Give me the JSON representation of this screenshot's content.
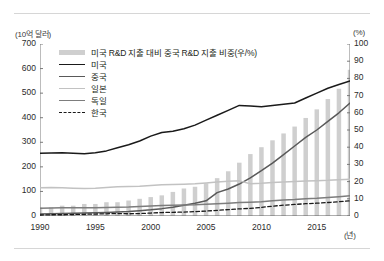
{
  "axes": {
    "left_unit": "(10억 달러)",
    "right_unit": "(%)",
    "x_unit": "(년)"
  },
  "legend": [
    {
      "label": "미국 R&D 지출 대비 중국 R&D 지출 비중(우/%)",
      "key": "bar",
      "color": "#cfcfcf"
    },
    {
      "label": "미국",
      "key": "line",
      "color": "#1a1a1a"
    },
    {
      "label": "중국",
      "key": "line",
      "color": "#595959"
    },
    {
      "label": "일본",
      "key": "line",
      "color": "#c2c2c2"
    },
    {
      "label": "독일",
      "key": "line",
      "color": "#7d7d7d"
    },
    {
      "label": "한국",
      "key": "dashed",
      "color": "#1a1a1a"
    }
  ],
  "chart_data": {
    "type": "line",
    "title": "",
    "xlabel": "(년)",
    "ylabel": "(10억 달러)",
    "y2label": "(%)",
    "ylim": [
      0,
      700
    ],
    "y2lim": [
      0,
      100
    ],
    "xlim": [
      1990,
      2018
    ],
    "grid": false,
    "legend_position": "top-left",
    "y_ticks": [
      0,
      100,
      200,
      300,
      400,
      500,
      600,
      700
    ],
    "y2_ticks": [
      0,
      10,
      20,
      30,
      40,
      50,
      60,
      70,
      80,
      90,
      100
    ],
    "x_ticks": [
      1990,
      1995,
      2000,
      2005,
      2010,
      2015
    ],
    "x": [
      1990,
      1991,
      1992,
      1993,
      1994,
      1995,
      1996,
      1997,
      1998,
      1999,
      2000,
      2001,
      2002,
      2003,
      2004,
      2005,
      2006,
      2007,
      2008,
      2009,
      2010,
      2011,
      2012,
      2013,
      2014,
      2015,
      2016,
      2017,
      2018
    ],
    "bars": {
      "name": "미국 R&D 지출 대비 중국 R&D 지출 비중(우/%)",
      "axis": "right",
      "unit": "%",
      "color": "#cfcfcf",
      "values": [
        5,
        5,
        6,
        6,
        7,
        7,
        8,
        8,
        9,
        10,
        11,
        12,
        14,
        16,
        17,
        19,
        22,
        26,
        31,
        36,
        40,
        44,
        48,
        52,
        57,
        62,
        68,
        74,
        85
      ]
    },
    "series": [
      {
        "name": "미국",
        "axis": "left",
        "color": "#1a1a1a",
        "style": "solid",
        "values": [
          255,
          256,
          257,
          255,
          253,
          257,
          265,
          278,
          290,
          305,
          325,
          340,
          345,
          355,
          370,
          390,
          410,
          430,
          450,
          448,
          445,
          450,
          455,
          460,
          480,
          500,
          520,
          535,
          550
        ]
      },
      {
        "name": "중국",
        "axis": "left",
        "color": "#595959",
        "style": "solid",
        "values": [
          8,
          9,
          10,
          11,
          12,
          13,
          14,
          16,
          18,
          21,
          25,
          30,
          36,
          44,
          52,
          62,
          95,
          110,
          130,
          155,
          185,
          215,
          250,
          285,
          320,
          350,
          385,
          420,
          460
        ]
      },
      {
        "name": "일본",
        "axis": "left",
        "color": "#c2c2c2",
        "style": "solid",
        "values": [
          115,
          116,
          115,
          113,
          112,
          113,
          116,
          119,
          120,
          121,
          124,
          127,
          128,
          129,
          131,
          134,
          138,
          141,
          143,
          131,
          133,
          136,
          138,
          140,
          142,
          143,
          145,
          148,
          150
        ]
      },
      {
        "name": "독일",
        "axis": "left",
        "color": "#7d7d7d",
        "style": "solid",
        "values": [
          32,
          33,
          34,
          34,
          34,
          34,
          35,
          36,
          37,
          39,
          41,
          43,
          44,
          45,
          46,
          48,
          50,
          52,
          55,
          56,
          58,
          62,
          65,
          67,
          70,
          72,
          75,
          78,
          82
        ]
      },
      {
        "name": "한국",
        "axis": "left",
        "color": "#1a1a1a",
        "style": "dashed",
        "values": [
          4,
          5,
          5,
          6,
          7,
          8,
          9,
          10,
          9,
          10,
          12,
          14,
          15,
          16,
          18,
          20,
          23,
          26,
          29,
          31,
          35,
          40,
          44,
          47,
          50,
          52,
          55,
          58,
          62
        ]
      }
    ]
  }
}
